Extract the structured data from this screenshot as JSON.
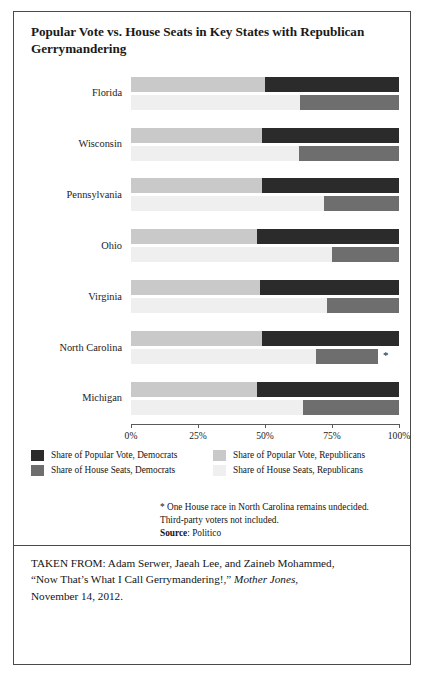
{
  "figure": {
    "title": "Popular Vote vs. House Seats in Key States with Republican Gerrymandering"
  },
  "legend": {
    "items": [
      {
        "label": "Share of Popular Vote, Democrats",
        "color": "#2b2b2b"
      },
      {
        "label": "Share of Popular Vote, Republicans",
        "color": "#c9c9c9"
      },
      {
        "label": "Share of House Seats, Democrats",
        "color": "#6e6e6e"
      },
      {
        "label": "Share of House Seats, Republicans",
        "color": "#efefef"
      }
    ]
  },
  "notes": {
    "footnote_1": "* One House race in North Carolina remains undecided.",
    "footnote_2": "Third-party voters not included.",
    "source_label": "Source",
    "source_sep": ": ",
    "source_value": "Politico"
  },
  "attribution": {
    "line1_prefix": "TAKEN FROM: Adam Serwer, Jaeah Lee, and Zaineb Mohammed,",
    "line2_prefix": "“Now That’s What I Call Gerrymandering!,” ",
    "line2_italic": "Mother Jones",
    "line2_suffix": ",",
    "line3": "November 14, 2012."
  },
  "chart_data": {
    "type": "bar",
    "orientation": "horizontal",
    "stacked": true,
    "stack_mode": "percent",
    "title": "Popular Vote vs. House Seats in Key States with Republican Gerrymandering",
    "xlabel": "",
    "ylabel": "",
    "xlim": [
      0,
      100
    ],
    "xticks": [
      0,
      25,
      50,
      75,
      100
    ],
    "xtick_labels": [
      "0%",
      "25%",
      "50%",
      "75%",
      "100%"
    ],
    "grid": false,
    "legend_position": "below-plot",
    "categories": [
      "Florida",
      "Wisconsin",
      "Pennsylvania",
      "Ohio",
      "Virginia",
      "North Carolina",
      "Michigan"
    ],
    "series": [
      {
        "name": "Share of Popular Vote, Republicans",
        "color": "#c9c9c9",
        "measure": "popular_vote_republican_pct",
        "values": [
          50,
          49,
          49,
          47,
          48,
          49,
          47
        ]
      },
      {
        "name": "Share of Popular Vote, Democrats",
        "color": "#2b2b2b",
        "measure": "popular_vote_democrat_pct",
        "values": [
          50,
          51,
          51,
          53,
          52,
          51,
          53
        ]
      },
      {
        "name": "Share of House Seats, Republicans",
        "color": "#efefef",
        "measure": "house_seats_republican_pct",
        "values": [
          63,
          62.5,
          72,
          75,
          73,
          69,
          64
        ]
      },
      {
        "name": "Share of House Seats, Democrats",
        "color": "#6e6e6e",
        "measure": "house_seats_democrat_pct",
        "values": [
          37,
          37.5,
          28,
          25,
          27,
          23,
          36
        ]
      }
    ],
    "annotations": [
      {
        "text": "*",
        "category": "North Carolina",
        "row": "house_seats",
        "x": 94,
        "note": "One House race in North Carolina remains undecided."
      }
    ],
    "rows": [
      {
        "state": "Florida",
        "popular_vote": {
          "democrats": 50,
          "republicans": 50
        },
        "house_seats": {
          "democrats": 37,
          "republicans": 63
        }
      },
      {
        "state": "Wisconsin",
        "popular_vote": {
          "democrats": 51,
          "republicans": 49
        },
        "house_seats": {
          "democrats": 37.5,
          "republicans": 62.5
        }
      },
      {
        "state": "Pennsylvania",
        "popular_vote": {
          "democrats": 51,
          "republicans": 49
        },
        "house_seats": {
          "democrats": 28,
          "republicans": 72
        }
      },
      {
        "state": "Ohio",
        "popular_vote": {
          "democrats": 53,
          "republicans": 47
        },
        "house_seats": {
          "democrats": 25,
          "republicans": 75
        }
      },
      {
        "state": "Virginia",
        "popular_vote": {
          "democrats": 52,
          "republicans": 48
        },
        "house_seats": {
          "democrats": 27,
          "republicans": 73
        }
      },
      {
        "state": "North Carolina",
        "popular_vote": {
          "democrats": 51,
          "republicans": 49
        },
        "house_seats": {
          "democrats": 23,
          "republicans": 69,
          "undecided": 8
        }
      },
      {
        "state": "Michigan",
        "popular_vote": {
          "democrats": 53,
          "republicans": 47
        },
        "house_seats": {
          "democrats": 36,
          "republicans": 64
        }
      }
    ]
  }
}
